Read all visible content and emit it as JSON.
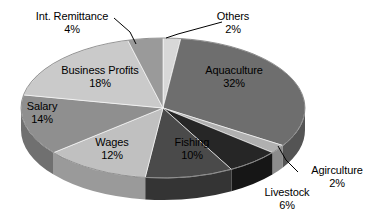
{
  "chart_data": {
    "type": "pie",
    "title": "",
    "subtitle": "",
    "xlabel": "",
    "ylabel": "",
    "legend_position": "none",
    "grid": false,
    "three_d": true,
    "start_angle_deg": 0,
    "direction": "clockwise",
    "units": "percent",
    "total": 100,
    "categories": [
      "Others",
      "Aquaculture",
      "Agirculture",
      "Livestock",
      "Fishing",
      "Wages",
      "Salary",
      "Business Profits",
      "Int. Remittance"
    ],
    "values": [
      2,
      32,
      2,
      6,
      10,
      12,
      14,
      18,
      4
    ],
    "value_labels": [
      "2%",
      "32%",
      "2%",
      "6%",
      "10%",
      "12%",
      "14%",
      "18%",
      "4%"
    ],
    "colors": [
      "#d8d8d8",
      "#6e6e6e",
      "#b0b0b0",
      "#262626",
      "#4a4a4a",
      "#c0c0c0",
      "#8f8f8f",
      "#cacaca",
      "#9a9a9a"
    ],
    "slices": [
      {
        "name": "Others",
        "value": 2,
        "value_label": "2%",
        "color": "#d8d8d8",
        "side_color": "#b0b0b0",
        "label_placement": "outside",
        "leader_line": true
      },
      {
        "name": "Aquaculture",
        "value": 32,
        "value_label": "32%",
        "color": "#6e6e6e",
        "side_color": "#545454",
        "label_placement": "inside",
        "leader_line": false
      },
      {
        "name": "Agirculture",
        "value": 2,
        "value_label": "2%",
        "color": "#b0b0b0",
        "side_color": "#8c8c8c",
        "label_placement": "outside",
        "leader_line": true
      },
      {
        "name": "Livestock",
        "value": 6,
        "value_label": "6%",
        "color": "#262626",
        "side_color": "#161616",
        "label_placement": "outside",
        "leader_line": false
      },
      {
        "name": "Fishing",
        "value": 10,
        "value_label": "10%",
        "color": "#4a4a4a",
        "side_color": "#343434",
        "label_placement": "inside",
        "leader_line": false
      },
      {
        "name": "Wages",
        "value": 12,
        "value_label": "12%",
        "color": "#c0c0c0",
        "side_color": "#9a9a9a",
        "label_placement": "inside",
        "leader_line": false
      },
      {
        "name": "Salary",
        "value": 14,
        "value_label": "14%",
        "color": "#8f8f8f",
        "side_color": "#707070",
        "label_placement": "inside",
        "leader_line": false
      },
      {
        "name": "Business Profits",
        "value": 18,
        "value_label": "18%",
        "color": "#cacaca",
        "side_color": "#a2a2a2",
        "label_placement": "inside",
        "leader_line": false
      },
      {
        "name": "Int. Remittance",
        "value": 4,
        "value_label": "4%",
        "color": "#9a9a9a",
        "side_color": "#787878",
        "label_placement": "outside",
        "leader_line": true
      }
    ],
    "background_color": "#ffffff",
    "label_text_color": "#000000"
  },
  "labels": {
    "int_remittance": {
      "name": "Int. Remittance",
      "pct": "4%"
    },
    "others": {
      "name": "Others",
      "pct": "2%"
    },
    "business_profits": {
      "name": "Business Profits",
      "pct": "18%"
    },
    "aquaculture": {
      "name": "Aquaculture",
      "pct": "32%"
    },
    "salary": {
      "name": "Salary",
      "pct": "14%"
    },
    "wages": {
      "name": "Wages",
      "pct": "12%"
    },
    "fishing": {
      "name": "Fishing",
      "pct": "10%"
    },
    "agriculture": {
      "name": "Agirculture",
      "pct": "2%"
    },
    "livestock": {
      "name": "Livestock",
      "pct": "6%"
    }
  }
}
